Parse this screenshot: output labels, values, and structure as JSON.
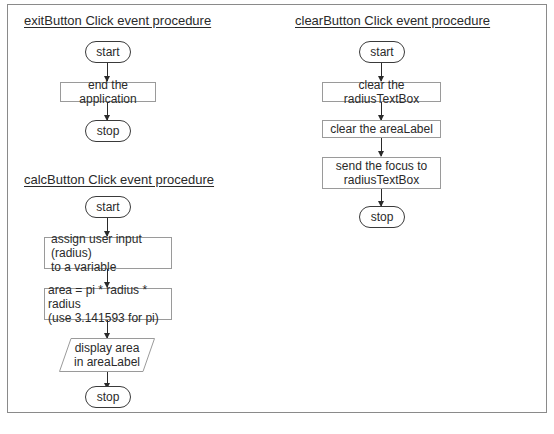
{
  "diagram": {
    "type": "flowchart",
    "frame_color": "#8a8a8a",
    "procedures": [
      {
        "title": "exitButton Click event procedure",
        "steps": [
          {
            "shape": "terminal",
            "text": "start"
          },
          {
            "shape": "process",
            "text": "end the application"
          },
          {
            "shape": "terminal",
            "text": "stop"
          }
        ]
      },
      {
        "title": "calcButton Click event procedure",
        "steps": [
          {
            "shape": "terminal",
            "text": "start"
          },
          {
            "shape": "process",
            "text": "assign user input (radius)\nto a variable"
          },
          {
            "shape": "process",
            "text": "area = pi * radius * radius\n(use 3.141593 for pi)"
          },
          {
            "shape": "input-output",
            "text": "display area\nin areaLabel"
          },
          {
            "shape": "terminal",
            "text": "stop"
          }
        ]
      },
      {
        "title": "clearButton Click event procedure",
        "steps": [
          {
            "shape": "terminal",
            "text": "start"
          },
          {
            "shape": "process",
            "text": "clear the radiusTextBox"
          },
          {
            "shape": "process",
            "text": "clear the areaLabel"
          },
          {
            "shape": "process",
            "text": "send the focus to\nradiusTextBox"
          },
          {
            "shape": "terminal",
            "text": "stop"
          }
        ]
      }
    ]
  }
}
